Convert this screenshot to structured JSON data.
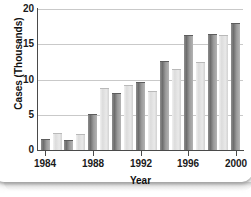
{
  "chart_data": {
    "type": "bar",
    "title": "",
    "xlabel": "Year",
    "ylabel": "Cases (Thousands)",
    "ylim": [
      0,
      20
    ],
    "xlim": [
      1983.4,
      2000.6
    ],
    "yticks": [
      0,
      5,
      10,
      15,
      20
    ],
    "ytick_labels": [
      "0",
      "5",
      "10",
      "15",
      "20"
    ],
    "xticks": [
      1984,
      1988,
      1992,
      1996,
      2000
    ],
    "xtick_labels": [
      "1984",
      "1988",
      "1992",
      "1996",
      "2000"
    ],
    "grid": true,
    "grid_axis": "y",
    "legend": "none",
    "categories": [
      1984,
      1985,
      1986,
      1987,
      1988,
      1989,
      1990,
      1991,
      1992,
      1993,
      1994,
      1995,
      1996,
      1997,
      1998,
      1999,
      2000
    ],
    "values": [
      1.4,
      2.2,
      1.3,
      2.1,
      5.0,
      8.7,
      8.0,
      9.1,
      9.5,
      8.2,
      12.5,
      11.4,
      16.2,
      12.3,
      16.3,
      16.1,
      17.9
    ],
    "bar_shades": [
      "dark",
      "light",
      "dark",
      "light",
      "dark",
      "light",
      "dark",
      "light",
      "dark",
      "light",
      "dark",
      "light",
      "dark",
      "light",
      "dark",
      "light",
      "dark"
    ]
  },
  "colors": {
    "axis": "#4a4a4a",
    "gridline": "#c9c9c9",
    "text": "#111111",
    "background": "#ffffff",
    "bar_dark": "#6e6e6e",
    "bar_light": "#dcdcdc"
  }
}
